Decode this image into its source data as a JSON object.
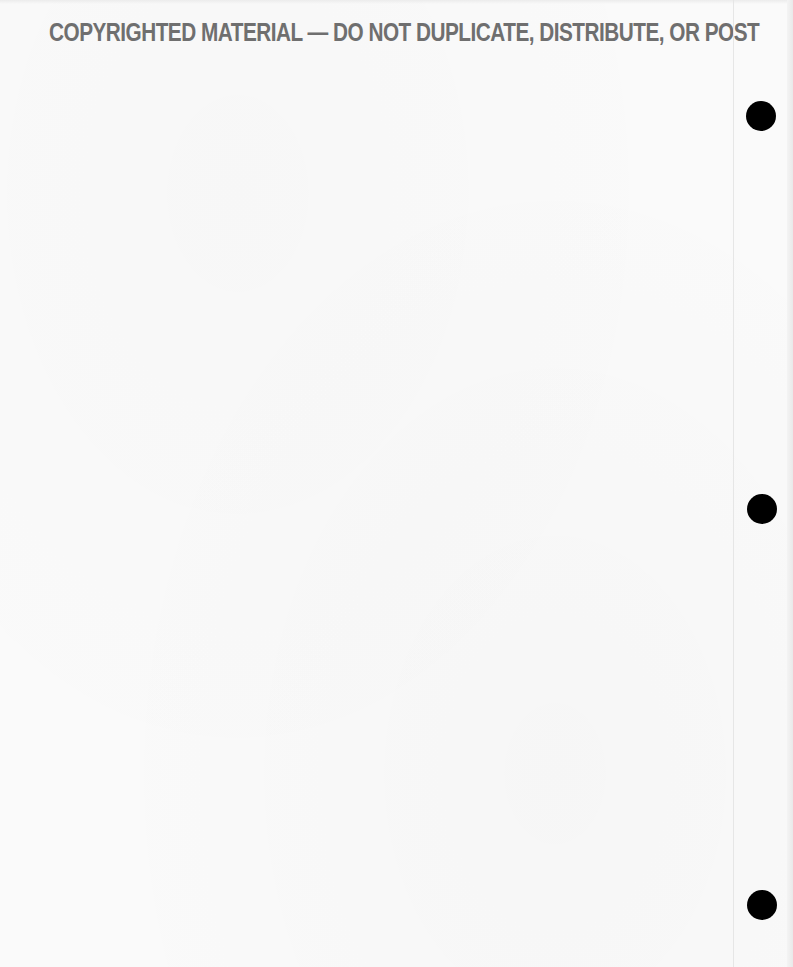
{
  "document": {
    "banner_text": "COPYRIGHTED MATERIAL — DO NOT DUPLICATE, DISTRIBUTE, OR POST",
    "banner_color": "#6f6f6f",
    "background_color": "#fafafa"
  },
  "punch_holes": [
    {
      "name": "punch-hole-top",
      "cx": 761,
      "cy": 116
    },
    {
      "name": "punch-hole-middle",
      "cx": 762,
      "cy": 509
    },
    {
      "name": "punch-hole-bottom",
      "cx": 762,
      "cy": 905
    }
  ]
}
